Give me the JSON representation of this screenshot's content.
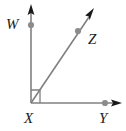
{
  "figure": {
    "type": "geometry-diagram",
    "background_color": "#ffffff",
    "ray_color": "#808080",
    "arrowhead_color": "#1a1a1a",
    "point_color": "#8c8c8c",
    "label_color": "#1a1a1a",
    "right_angle_marker": true
  },
  "labels": {
    "w": "W",
    "z": "Z",
    "x": "X",
    "y": "Y"
  },
  "geometry": {
    "vertex": {
      "name": "X",
      "x": 31,
      "y": 103
    },
    "rays": [
      {
        "name": "ray-XW",
        "from": [
          31,
          103
        ],
        "to": [
          31,
          8
        ],
        "arrow": true
      },
      {
        "name": "ray-XZ",
        "from": [
          31,
          103
        ],
        "to": [
          92,
          12
        ],
        "arrow": true
      },
      {
        "name": "ray-XY",
        "from": [
          31,
          103
        ],
        "to": [
          121,
          103
        ],
        "arrow": true
      }
    ],
    "points": [
      {
        "name": "W",
        "x": 31,
        "y": 25
      },
      {
        "name": "Z",
        "x": 78,
        "y": 31
      },
      {
        "name": "Y",
        "x": 105,
        "y": 103
      }
    ],
    "right_angle": {
      "at": "X",
      "between": [
        "ray-XW",
        "ray-XZ"
      ],
      "size": 13
    }
  }
}
